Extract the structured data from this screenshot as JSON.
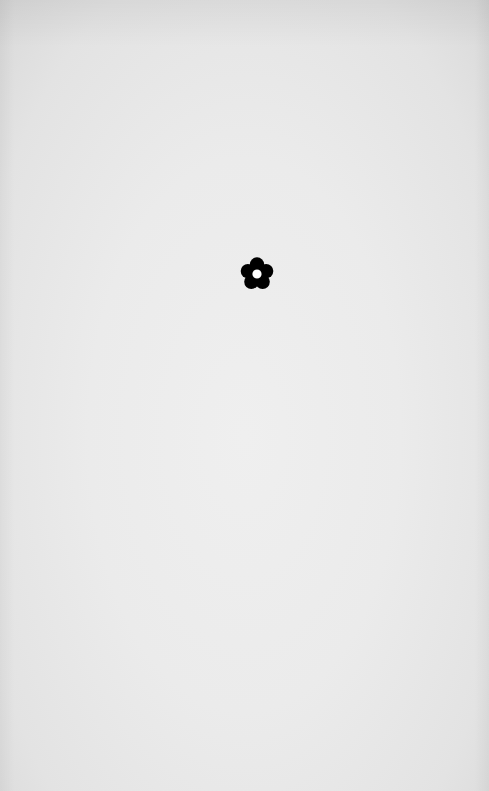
{
  "screen": {
    "type": "loading-splash",
    "background_color": "#ebebeb"
  },
  "loader": {
    "icon": "flower-icon",
    "color": "#000000",
    "center_color": "#ffffff",
    "label": "Loading"
  }
}
